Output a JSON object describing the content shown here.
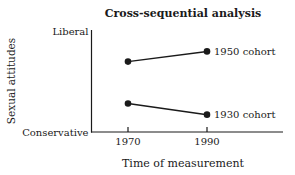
{
  "colors": {
    "ink": "#1a1a1a",
    "background": "#ffffff"
  },
  "chart_data": {
    "type": "line",
    "title": "Cross-sequential analysis",
    "xlabel": "Time of measurement",
    "ylabel": "Sexual attitudes",
    "x": [
      1970,
      1990
    ],
    "x_tick_labels": [
      "1970",
      "1990"
    ],
    "y_axis_endpoints": [
      "Conservative",
      "Liberal"
    ],
    "ylim": [
      0,
      1
    ],
    "grid": false,
    "legend_position": "labels-right-of-last-point",
    "series": [
      {
        "name": "1950 cohort",
        "marker": "filled-circle",
        "values": [
          0.69,
          0.79
        ]
      },
      {
        "name": "1930 cohort",
        "marker": "filled-circle",
        "values": [
          0.28,
          0.17
        ]
      }
    ]
  }
}
